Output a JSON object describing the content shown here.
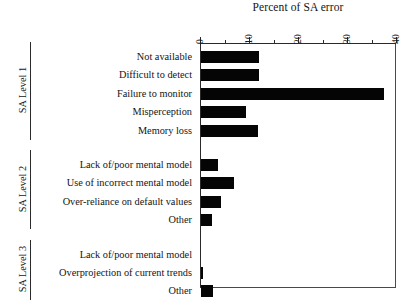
{
  "chart_data": {
    "type": "bar",
    "orientation": "horizontal",
    "title": "Percent of SA error",
    "xlabel": "Percent of SA error",
    "ylabel": "",
    "xlim": [
      0,
      40
    ],
    "xticks": [
      0,
      10,
      20,
      30,
      40
    ],
    "xtick_labels": [
      "0",
      "10",
      "20",
      "30",
      "40"
    ],
    "minor_tick_step": 5,
    "grid": false,
    "legend": null,
    "bar_color": "#050505",
    "axis_color": "#2a2a2a",
    "groups": [
      {
        "name": "SA Level 1",
        "categories": [
          "Not available",
          "Difficult to detect",
          "Failure to monitor",
          "Misperception",
          "Memory loss"
        ],
        "values": [
          11.8,
          11.8,
          37.3,
          9.2,
          11.6
        ]
      },
      {
        "name": "SA Level 2",
        "categories": [
          "Lack of/poor mental model",
          "Use of incorrect mental model",
          "Over-reliance on default values",
          "Other"
        ],
        "values": [
          3.5,
          6.7,
          4.1,
          2.2
        ]
      },
      {
        "name": "SA Level 3",
        "categories": [
          "Lack of/poor mental model",
          "Overprojection of current trends",
          "Other"
        ],
        "values": [
          0.0,
          0.5,
          2.5
        ]
      }
    ]
  }
}
